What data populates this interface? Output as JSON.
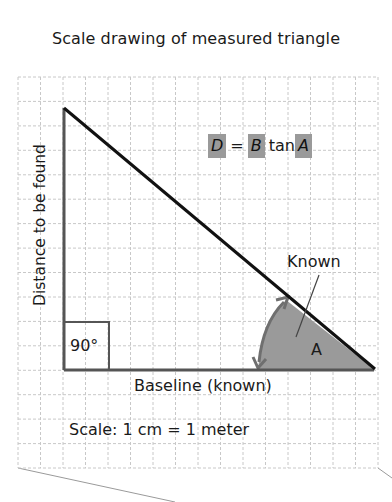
{
  "title": "Scale drawing of measured triangle",
  "diagram": {
    "formula": {
      "lhs": "D",
      "equals": "=",
      "base": "B",
      "func": "tan",
      "angle": "A",
      "highlight_color": "#9a9a9a"
    },
    "labels": {
      "vertical_side": "Distance to be found",
      "baseline": "Baseline (known)",
      "right_angle": "90°",
      "angle_name": "A",
      "known": "Known",
      "scale": "Scale: 1 cm = 1 meter"
    },
    "grid": {
      "columns": 16,
      "rows": 16,
      "line_color": "#c8c8c8"
    },
    "colors": {
      "hypotenuse": "#111111",
      "legs": "#555555",
      "angle_fill": "#9a9a9a",
      "arc": "#6f6f6f"
    }
  }
}
